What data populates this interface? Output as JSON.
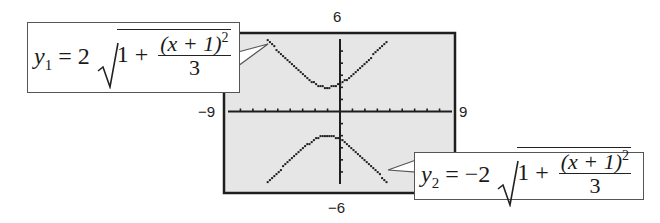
{
  "chart_data": {
    "type": "line",
    "title": "",
    "xlabel": "",
    "ylabel": "",
    "xlim": [
      -9,
      9
    ],
    "ylim": [
      -6,
      6
    ],
    "grid": false,
    "legend": "callouts",
    "tick_labels": {
      "ymax": "6",
      "ymin": "−6",
      "xmin": "−9",
      "xmax": "9"
    },
    "x_ticks_step": 1,
    "y_ticks_step": 1,
    "series": [
      {
        "name": "y1",
        "equation": "y1 = 2√(1 + (x+1)²/3)",
        "coef": 2,
        "shift": 1,
        "denominator": 3,
        "x": [
          -5.9,
          -5,
          -4,
          -3,
          -2,
          -1,
          0,
          1,
          2,
          3,
          3.9
        ],
        "values": [
          6.0,
          5.26,
          4.47,
          3.46,
          2.31,
          2.0,
          2.31,
          3.06,
          4.0,
          5.03,
          6.0
        ]
      },
      {
        "name": "y2",
        "equation": "y2 = −2√(1 + (x+1)²/3)",
        "coef": -2,
        "shift": 1,
        "denominator": 3,
        "x": [
          -5.9,
          -5,
          -4,
          -3,
          -2,
          -1,
          0,
          1,
          2,
          3,
          3.9
        ],
        "values": [
          -6.0,
          -5.26,
          -4.47,
          -3.46,
          -2.31,
          -2.0,
          -2.31,
          -3.06,
          -4.0,
          -5.03,
          -6.0
        ]
      }
    ]
  },
  "labels": {
    "ymax": "6",
    "ymin": "−6",
    "xmin": "−9",
    "xmax": "9"
  },
  "callouts": {
    "y1": {
      "var": "y",
      "sub": "1",
      "eq": " = 2",
      "one_plus": "1 + ",
      "num": "(x + 1)",
      "exp": "2",
      "den": "3"
    },
    "y2": {
      "var": "y",
      "sub": "2",
      "eq": " = −2",
      "one_plus": "1 + ",
      "num": "(x + 1)",
      "exp": "2",
      "den": "3"
    }
  },
  "colors": {
    "screen_bg": "#e6e6e6",
    "frame": "#1e1e1e",
    "curve": "#1e1e1e"
  }
}
